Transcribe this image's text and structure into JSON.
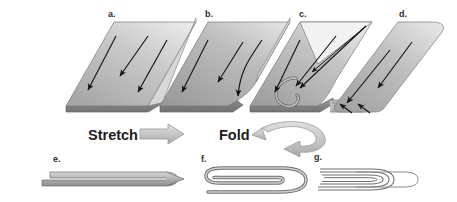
{
  "figure": {
    "background_color": "#ffffff",
    "width": 457,
    "height": 202
  },
  "colors": {
    "slab_light": "#e3e3e3",
    "slab_mid": "#b4b4b4",
    "slab_dark": "#8e8e8e",
    "slab_edge": "#6f6f6f",
    "outline": "#6b6b6b",
    "arrow_black": "#141414",
    "process_arrow_fill": "#c9c9c9",
    "process_arrow_stroke": "#9a9a9a",
    "label_text": "#2e2e2e",
    "process_text": "#1c1c1c"
  },
  "panels": {
    "top_row": [
      {
        "id": "a",
        "label": "a.",
        "label_x": 108,
        "label_y": 10,
        "description": "flat parallelogram slab with three parallel straight flow arrows"
      },
      {
        "id": "b",
        "label": "b.",
        "label_x": 205,
        "label_y": 10,
        "description": "slab beginning to deform, curved notch on right edge, curving flow arrow"
      },
      {
        "id": "c",
        "label": "c.",
        "label_x": 299,
        "label_y": 10,
        "description": "slab folding over itself, curled hook at lower left, converging arrows"
      },
      {
        "id": "d",
        "label": "d.",
        "label_x": 399,
        "label_y": 10,
        "description": "folded slab with rounded ends and layered fold stack at lower left"
      }
    ],
    "bottom_row": [
      {
        "id": "e",
        "label": "e.",
        "label_x": 53,
        "label_y": 155,
        "description": "single folded ribbon, two layers, pointed right tip"
      },
      {
        "id": "f",
        "label": "f.",
        "label_x": 201,
        "label_y": 155,
        "description": "ribbon folded three times, nested U-shaped layers"
      },
      {
        "id": "g",
        "label": "g.",
        "label_x": 314,
        "label_y": 153,
        "description": "ribbon folded many times, finely nested thin layers"
      }
    ]
  },
  "process_labels": [
    {
      "id": "stretch",
      "text": "Stretch",
      "x": 88,
      "y": 131,
      "arrow": "straight-block-arrow-right"
    },
    {
      "id": "fold",
      "text": "Fold",
      "x": 219,
      "y": 131,
      "arrow": "curved-ribbon-arrow-left"
    }
  ],
  "icons": {
    "stretch_arrow": "block-arrow-right-icon",
    "fold_arrow": "curved-arrow-left-icon",
    "flow_arrow": "flow-arrow-icon"
  }
}
